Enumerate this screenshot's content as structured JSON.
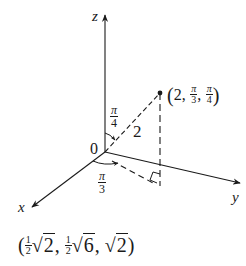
{
  "diagram": {
    "type": "spherical-coordinates-3d-axes",
    "axes": {
      "x_label": "x",
      "y_label": "y",
      "z_label": "z",
      "origin_label": "0"
    },
    "point": {
      "label_open": "(",
      "rho": "2",
      "theta_num": "π",
      "theta_den": "3",
      "phi_num": "π",
      "phi_den": "4",
      "label_close": ")",
      "comma": ","
    },
    "segment_length_label": "2",
    "angle_phi": {
      "num": "π",
      "den": "4"
    },
    "angle_theta": {
      "num": "π",
      "den": "3"
    },
    "cartesian": {
      "open": "(",
      "c1_num": "1",
      "c1_den": "2",
      "c1_rad": "2",
      "c2_num": "1",
      "c2_den": "2",
      "c2_rad": "6",
      "c3_rad": "2",
      "comma": ",",
      "close": ")",
      "sqrt_symbol": "√"
    },
    "colors": {
      "ink": "#1a1a1a",
      "background": "#ffffff"
    }
  }
}
